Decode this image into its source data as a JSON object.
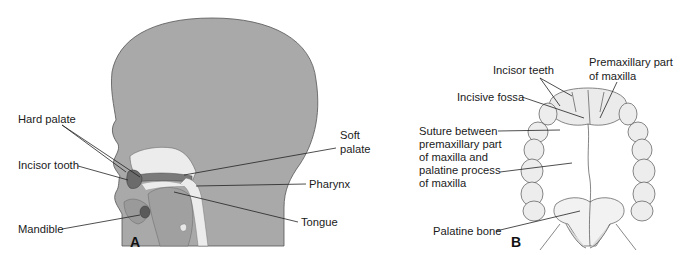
{
  "figure": {
    "panel_a": {
      "letter": "A",
      "labels": {
        "hard_palate": "Hard palate",
        "incisor_tooth": "Incisor tooth",
        "mandible": "Mandible",
        "soft_palate_1": "Soft",
        "soft_palate_2": "palate",
        "pharynx": "Pharynx",
        "tongue": "Tongue"
      }
    },
    "panel_b": {
      "letter": "B",
      "labels": {
        "incisor_teeth": "Incisor teeth",
        "premaxillary_1": "Premaxillary part",
        "premaxillary_2": "of maxilla",
        "incisive_fossa": "Incisive fossa",
        "suture_1": "Suture between",
        "suture_2": "premaxillary part",
        "suture_3": "of maxilla and",
        "suture_4": "palatine process",
        "suture_5": "of maxilla",
        "palatine_bone": "Palatine bone"
      }
    },
    "colors": {
      "head_fill": "#a9a9a9",
      "outline": "#555555",
      "light_fill": "#e6e6e6",
      "dark_fill": "#6e6e6e",
      "leader": "#222222"
    }
  }
}
